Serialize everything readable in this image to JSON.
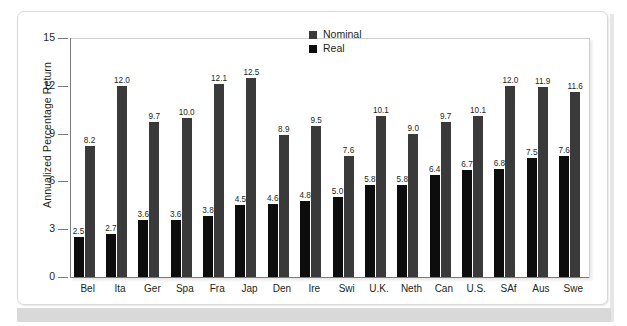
{
  "chart_data": {
    "type": "bar",
    "title": "",
    "subtitle": "",
    "xlabel": "",
    "ylabel": "Annualized Percentage Return",
    "ylim": [
      0,
      15
    ],
    "yticks": [
      "0",
      "3",
      "6",
      "9",
      "12",
      "15"
    ],
    "grid": false,
    "legend_position": "top-right-inside",
    "categories": [
      "Bel",
      "Ita",
      "Ger",
      "Spa",
      "Fra",
      "Jap",
      "Den",
      "Ire",
      "Swi",
      "U.K.",
      "Neth",
      "Can",
      "U.S.",
      "SAf",
      "Aus",
      "Swe"
    ],
    "series": [
      {
        "name": "Real",
        "color": "#0d0d0d",
        "values": [
          2.5,
          2.7,
          3.6,
          3.6,
          3.8,
          4.5,
          4.6,
          4.8,
          5.0,
          5.8,
          5.8,
          6.4,
          6.7,
          6.8,
          7.5,
          7.6
        ],
        "labels": [
          "2.5",
          "2.7",
          "3.6",
          "3.6",
          "3.8",
          "4.5",
          "4.6",
          "4.8",
          "5.0",
          "5.8",
          "5.8",
          "6.4",
          "6.7",
          "6.8",
          "7.5",
          "7.6"
        ]
      },
      {
        "name": "Nominal",
        "color": "#3a3a3a",
        "values": [
          8.2,
          12.0,
          9.7,
          10.0,
          12.1,
          12.5,
          8.9,
          9.5,
          7.6,
          10.1,
          9.0,
          9.7,
          10.1,
          12.0,
          11.9,
          11.6
        ],
        "labels": [
          "8.2",
          "12.0",
          "9.7",
          "10.0",
          "12.1",
          "12.5",
          "8.9",
          "9.5",
          "7.6",
          "10.1",
          "9.0",
          "9.7",
          "10.1",
          "12.0",
          "11.9",
          "11.6"
        ]
      }
    ],
    "legend": [
      {
        "label": "Nominal",
        "color": "#3a3a3a"
      },
      {
        "label": "Real",
        "color": "#0d0d0d"
      }
    ]
  },
  "colors": {
    "nominal": "#3a3a3a",
    "real": "#0d0d0d",
    "axis": "#7a7a7a",
    "frame": "#cfcfcf",
    "footer": "#d9d9d9",
    "text": "#231f20"
  }
}
